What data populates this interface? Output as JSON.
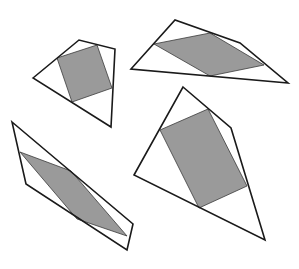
{
  "diagram": {
    "colors": {
      "background": "#ffffff",
      "outline": "#1a1a1a",
      "fill": "#9a9a9a"
    },
    "shapes": [
      {
        "id": "shape-top-left",
        "outer": [
          [
            33,
            78
          ],
          [
            79,
            40
          ],
          [
            115,
            49
          ],
          [
            111,
            127
          ]
        ],
        "inner": [
          [
            57,
            58
          ],
          [
            97,
            45
          ],
          [
            112,
            88
          ],
          [
            72,
            102
          ]
        ]
      },
      {
        "id": "shape-top-right",
        "outer": [
          [
            131,
            69
          ],
          [
            175,
            20
          ],
          [
            240,
            43
          ],
          [
            288,
            83
          ]
        ],
        "inner": [
          [
            154,
            44
          ],
          [
            210,
            33
          ],
          [
            264,
            65
          ],
          [
            210,
            76
          ]
        ]
      },
      {
        "id": "shape-bottom-left",
        "outer": [
          [
            12,
            122
          ],
          [
            133,
            224
          ],
          [
            127,
            250
          ],
          [
            26,
            184
          ]
        ],
        "inner": [
          [
            20,
            152
          ],
          [
            71,
            171
          ],
          [
            127,
            236
          ],
          [
            77,
            219
          ]
        ]
      },
      {
        "id": "shape-bottom-right",
        "outer": [
          [
            183,
            87
          ],
          [
            231,
            128
          ],
          [
            265,
            240
          ],
          [
            134,
            175
          ]
        ],
        "inner": [
          [
            160,
            130
          ],
          [
            208,
            109
          ],
          [
            247,
            186
          ],
          [
            199,
            208
          ]
        ]
      }
    ]
  }
}
